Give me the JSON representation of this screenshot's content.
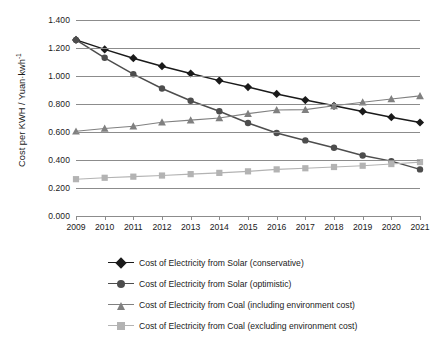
{
  "chart_data": {
    "type": "line",
    "title": "",
    "xlabel": "",
    "ylabel": "Cost per KWH / Yuan·kwh",
    "ylabel_sup": "-1",
    "categories": [
      2009,
      2010,
      2011,
      2012,
      2013,
      2014,
      2015,
      2016,
      2017,
      2018,
      2019,
      2020,
      2021
    ],
    "x_tick_labels": [
      "2009",
      "2010",
      "2011",
      "2012",
      "2013",
      "2014",
      "2015",
      "2016",
      "2017",
      "2018",
      "2019",
      "2020",
      "2021"
    ],
    "y_tick_labels": [
      "1.400",
      "1.200",
      "1.000",
      "0.800",
      "0.600",
      "0.400",
      "0.200",
      "0.000"
    ],
    "y_tick_values": [
      1.4,
      1.2,
      1.0,
      0.8,
      0.6,
      0.4,
      0.2,
      0.0
    ],
    "ylim": [
      0.0,
      1.4
    ],
    "grid": "horizontal",
    "legend_position": "bottom",
    "series": [
      {
        "name": "Cost of Electricity from Solar (conservative)",
        "marker": "diamond",
        "color": "#1a1a1a",
        "values": [
          1.258,
          1.19,
          1.127,
          1.07,
          1.018,
          0.967,
          0.921,
          0.872,
          0.828,
          0.787,
          0.747,
          0.706,
          0.668
        ]
      },
      {
        "name": "Cost of Electricity from Solar (optimistic)",
        "marker": "circle",
        "color": "#4d4d4d",
        "values": [
          1.258,
          1.13,
          1.013,
          0.911,
          0.823,
          0.748,
          0.664,
          0.593,
          0.54,
          0.487,
          0.432,
          0.392,
          0.333
        ]
      },
      {
        "name": "Cost of Electricity from Coal (including environment cost)",
        "marker": "triangle",
        "color": "#808080",
        "values": [
          0.605,
          0.625,
          0.641,
          0.67,
          0.685,
          0.7,
          0.731,
          0.757,
          0.76,
          0.787,
          0.813,
          0.836,
          0.858
        ]
      },
      {
        "name": "Cost of Electricity from Coal (excluding environment cost)",
        "marker": "square",
        "color": "#b3b3b3",
        "values": [
          0.263,
          0.273,
          0.281,
          0.289,
          0.299,
          0.308,
          0.319,
          0.333,
          0.341,
          0.35,
          0.359,
          0.371,
          0.385
        ]
      }
    ]
  },
  "legend": {
    "items": [
      "Cost of Electricity from Solar (conservative)",
      "Cost of Electricity from Solar (optimistic)",
      "Cost of Electricity from Coal (including environment cost)",
      "Cost of Electricity from Coal (excluding environment cost)"
    ]
  }
}
